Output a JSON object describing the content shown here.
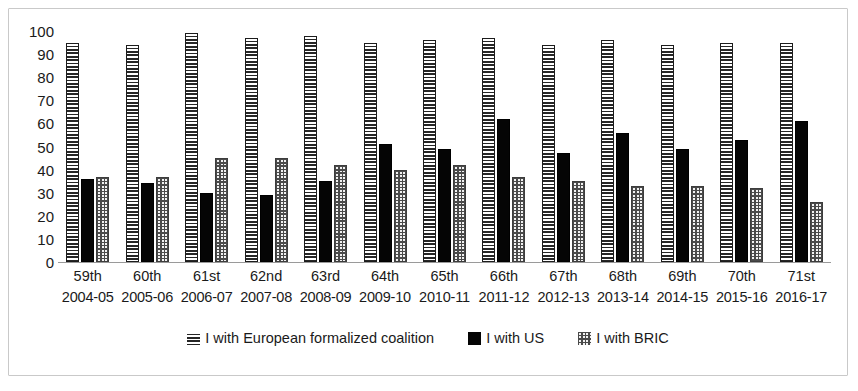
{
  "chart_data": {
    "type": "bar",
    "title": "",
    "xlabel": "",
    "ylabel": "",
    "ylim": [
      0,
      100
    ],
    "yticks": [
      100,
      90,
      80,
      70,
      60,
      50,
      40,
      30,
      20,
      10,
      0
    ],
    "grid": false,
    "legend_position": "bottom",
    "categories": [
      {
        "ordinal": "59th",
        "years": "2004-05"
      },
      {
        "ordinal": "60th",
        "years": "2005-06"
      },
      {
        "ordinal": "61st",
        "years": "2006-07"
      },
      {
        "ordinal": "62nd",
        "years": "2007-08"
      },
      {
        "ordinal": "63rd",
        "years": "2008-09"
      },
      {
        "ordinal": "64th",
        "years": "2009-10"
      },
      {
        "ordinal": "65th",
        "years": "2010-11"
      },
      {
        "ordinal": "66th",
        "years": "2011-12"
      },
      {
        "ordinal": "67th",
        "years": "2012-13"
      },
      {
        "ordinal": "68th",
        "years": "2013-14"
      },
      {
        "ordinal": "69th",
        "years": "2014-15"
      },
      {
        "ordinal": "70th",
        "years": "2015-16"
      },
      {
        "ordinal": "71st",
        "years": "2016-17"
      }
    ],
    "series": [
      {
        "name": "I with European formalized coalition",
        "pattern": "horizontal-stripes",
        "color": "#2a2a2a",
        "values": [
          95,
          94,
          99,
          97,
          98,
          95,
          96,
          97,
          94,
          96,
          94,
          95,
          95
        ]
      },
      {
        "name": "I with US",
        "pattern": "solid",
        "color": "#050505",
        "values": [
          36,
          34,
          30,
          29,
          35,
          51,
          49,
          62,
          47,
          56,
          49,
          53,
          61
        ]
      },
      {
        "name": "I with BRIC",
        "pattern": "dotted",
        "color": "#f2f2f2",
        "values": [
          37,
          37,
          45,
          45,
          42,
          40,
          42,
          37,
          35,
          33,
          33,
          32,
          26
        ]
      }
    ]
  },
  "legend": {
    "items": [
      {
        "label": "I with European formalized coalition",
        "swatch": "striped-swatch-icon"
      },
      {
        "label": "I with US",
        "swatch": "solid-swatch-icon"
      },
      {
        "label": "I with BRIC",
        "swatch": "dotted-swatch-icon"
      }
    ]
  }
}
